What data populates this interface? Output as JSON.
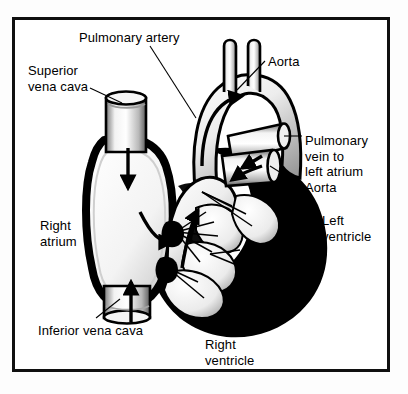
{
  "figure": {
    "style": "black-and-white anatomical line illustration",
    "border_color": "#101010",
    "background_color": "#ffffff",
    "ink_color": "#000000"
  },
  "labels": [
    {
      "id": "pulmonary-artery",
      "text": "Pulmonary artery",
      "x": 79,
      "y": 30,
      "align": "left"
    },
    {
      "id": "aorta-top",
      "text": "Aorta",
      "x": 268,
      "y": 54,
      "align": "left"
    },
    {
      "id": "superior-vena-cava",
      "text": "Superior\nvena cava",
      "x": 28,
      "y": 63,
      "align": "left"
    },
    {
      "id": "pulmonary-vein",
      "text": "Pulmonary\nvein to\nleft atrium\nAorta",
      "x": 305,
      "y": 133,
      "align": "left"
    },
    {
      "id": "right-atrium",
      "text": "Right\natrium",
      "x": 40,
      "y": 218,
      "align": "left"
    },
    {
      "id": "left-ventricle",
      "text": "Left\nventricle",
      "x": 322,
      "y": 213,
      "align": "left"
    },
    {
      "id": "inferior-vena-cava",
      "text": "Inferior vena cava",
      "x": 38,
      "y": 323,
      "align": "left"
    },
    {
      "id": "right-ventricle",
      "text": "Right\nventricle",
      "x": 205,
      "y": 337,
      "align": "left"
    }
  ],
  "leader_lines": [
    {
      "id": "leader-pulmonary-artery",
      "from": [
        150,
        46
      ],
      "to": [
        196,
        118
      ]
    },
    {
      "id": "leader-aorta-top",
      "from": [
        265,
        61
      ],
      "to": [
        237,
        90
      ]
    },
    {
      "id": "leader-superior-vena-cava",
      "from": [
        90,
        88
      ],
      "to": [
        122,
        103
      ]
    },
    {
      "id": "leader-pulmonary-vein",
      "from": [
        302,
        136
      ],
      "to": [
        284,
        136
      ]
    },
    {
      "id": "leader-aorta-lower",
      "from": [
        302,
        186
      ],
      "to": [
        270,
        166
      ]
    },
    {
      "id": "leader-inferior-vena-cava",
      "from": [
        96,
        318
      ],
      "to": [
        120,
        299
      ]
    }
  ],
  "flow_arrows": [
    {
      "id": "arrow-svc-down",
      "description": "blood descending superior vena cava into right atrium"
    },
    {
      "id": "arrow-ivc-up",
      "description": "blood ascending inferior vena cava into right atrium"
    },
    {
      "id": "arrow-ra-to-rv",
      "description": "right atrium through tricuspid valve to right ventricle"
    },
    {
      "id": "arrow-rv-to-pa",
      "description": "right ventricle up into pulmonary artery"
    },
    {
      "id": "arrow-aortic-arch",
      "description": "blood flowing over the aortic arch"
    },
    {
      "id": "arrow-lv-outflow",
      "description": "left ventricle outflow into aorta"
    },
    {
      "id": "arrow-pulmonary-vein-in",
      "description": "pulmonary vein entering left atrium"
    }
  ],
  "structures": [
    {
      "id": "aortic-arch",
      "name": "Aortic arch with brachiocephalic branches"
    },
    {
      "id": "pulmonary-trunk",
      "name": "Pulmonary trunk"
    },
    {
      "id": "superior-vena-cava-vessel",
      "name": "Superior vena cava"
    },
    {
      "id": "inferior-vena-cava-vessel",
      "name": "Inferior vena cava"
    },
    {
      "id": "right-atrium-chamber",
      "name": "Right atrium"
    },
    {
      "id": "right-ventricle-chamber",
      "name": "Right ventricle"
    },
    {
      "id": "left-ventricle-wall",
      "name": "Left ventricle myocardium"
    },
    {
      "id": "valve-leaflets",
      "name": "Atrioventricular valve leaflets"
    },
    {
      "id": "chordae-tendineae",
      "name": "Chordae tendineae"
    },
    {
      "id": "papillary-muscles",
      "name": "Papillary muscles"
    },
    {
      "id": "pulmonary-vein-stump",
      "name": "Pulmonary vein cut stump"
    },
    {
      "id": "aorta-stump",
      "name": "Descending aorta cut stump"
    }
  ]
}
